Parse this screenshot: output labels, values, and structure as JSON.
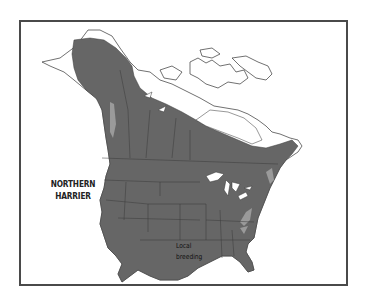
{
  "map": {
    "title_line1": "NORTHERN",
    "title_line2": "HARRIER",
    "annotation_line1": "Local",
    "annotation_line2": "breeding",
    "colors": {
      "range": "#666666",
      "local_breeding": "#9a9a9a",
      "land_outline": "#333333",
      "water": "#ffffff",
      "frame": "#4a4a4a"
    },
    "legend": [
      {
        "label": "Range (breeding/year-round)",
        "color": "#666666"
      },
      {
        "label": "Local breeding",
        "color": "#9a9a9a"
      }
    ]
  }
}
